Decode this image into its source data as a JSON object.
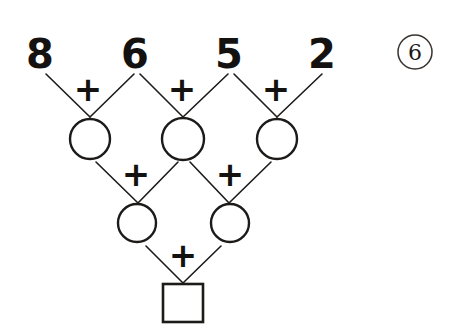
{
  "worksheet": {
    "problem_number": "6",
    "problem_number_style": "circled",
    "background_color": "#ffffff",
    "ink_color": "#1d1b19"
  },
  "puzzle": {
    "type": "addition-pyramid",
    "title": "Addition pyramid with four top numbers",
    "rows": [
      {
        "row_index": 0,
        "kind": "given-numbers",
        "cells": [
          {
            "id": "top-1",
            "label": "8",
            "filled": true,
            "shape": "none"
          },
          {
            "id": "top-2",
            "label": "6",
            "filled": true,
            "shape": "none"
          },
          {
            "id": "top-3",
            "label": "5",
            "filled": true,
            "shape": "none"
          },
          {
            "id": "top-4",
            "label": "2",
            "filled": true,
            "shape": "none"
          }
        ]
      },
      {
        "row_index": 1,
        "kind": "blank-circles",
        "cells": [
          {
            "id": "mid-1",
            "label": "",
            "filled": false,
            "shape": "circle"
          },
          {
            "id": "mid-2",
            "label": "",
            "filled": false,
            "shape": "circle"
          },
          {
            "id": "mid-3",
            "label": "",
            "filled": false,
            "shape": "circle"
          }
        ]
      },
      {
        "row_index": 2,
        "kind": "blank-circles",
        "cells": [
          {
            "id": "low-1",
            "label": "",
            "filled": false,
            "shape": "circle"
          },
          {
            "id": "low-2",
            "label": "",
            "filled": false,
            "shape": "circle"
          }
        ]
      },
      {
        "row_index": 3,
        "kind": "blank-square",
        "cells": [
          {
            "id": "answer",
            "label": "",
            "filled": false,
            "shape": "square"
          }
        ]
      }
    ],
    "operators": [
      {
        "id": "plus-r1-1",
        "symbol": "+"
      },
      {
        "id": "plus-r1-2",
        "symbol": "+"
      },
      {
        "id": "plus-r1-3",
        "symbol": "+"
      },
      {
        "id": "plus-r2-1",
        "symbol": "+"
      },
      {
        "id": "plus-r2-2",
        "symbol": "+"
      },
      {
        "id": "plus-r3-1",
        "symbol": "+"
      }
    ]
  }
}
